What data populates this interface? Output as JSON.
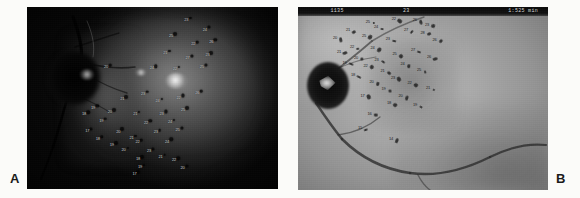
{
  "figure": {
    "background_color": "#fbfbf9",
    "panels": [
      {
        "id": "A",
        "label": "A",
        "modality": "fundus-photograph",
        "description": "Dark red-free fundus photograph of left eye showing optic disc nasally, bright exudative lesion near the macula, and scattered numbered grid annotations over the posterior pole.",
        "optic_disc_position": "left",
        "markers": [
          {
            "value": "23",
            "x": 63.5,
            "y": 7.0
          },
          {
            "value": "24",
            "x": 70.8,
            "y": 12.4
          },
          {
            "value": "25",
            "x": 57.4,
            "y": 16.0
          },
          {
            "value": "22",
            "x": 66.2,
            "y": 20.6
          },
          {
            "value": "26",
            "x": 73.4,
            "y": 19.1
          },
          {
            "value": "21",
            "x": 55.1,
            "y": 25.3
          },
          {
            "value": "27",
            "x": 64.0,
            "y": 27.9
          },
          {
            "value": "23",
            "x": 71.9,
            "y": 26.4
          },
          {
            "value": "20",
            "x": 31.5,
            "y": 33.1
          },
          {
            "value": "24",
            "x": 49.7,
            "y": 33.6
          },
          {
            "value": "22",
            "x": 59.0,
            "y": 34.2
          },
          {
            "value": "25",
            "x": 69.6,
            "y": 33.0
          },
          {
            "value": "21",
            "x": 38.0,
            "y": 50.6
          },
          {
            "value": "23",
            "x": 46.2,
            "y": 47.8
          },
          {
            "value": "19",
            "x": 26.3,
            "y": 55.4
          },
          {
            "value": "24",
            "x": 52.0,
            "y": 51.5
          },
          {
            "value": "22",
            "x": 60.4,
            "y": 49.8
          },
          {
            "value": "20",
            "x": 33.0,
            "y": 57.6
          },
          {
            "value": "26",
            "x": 67.8,
            "y": 47.4
          },
          {
            "value": "18",
            "x": 22.7,
            "y": 59.0
          },
          {
            "value": "21",
            "x": 43.1,
            "y": 58.9
          },
          {
            "value": "23",
            "x": 53.6,
            "y": 58.6
          },
          {
            "value": "25",
            "x": 62.2,
            "y": 56.6
          },
          {
            "value": "19",
            "x": 29.6,
            "y": 62.5
          },
          {
            "value": "22",
            "x": 47.4,
            "y": 63.6
          },
          {
            "value": "24",
            "x": 57.0,
            "y": 63.2
          },
          {
            "value": "17",
            "x": 24.0,
            "y": 68.2
          },
          {
            "value": "20",
            "x": 36.4,
            "y": 68.5
          },
          {
            "value": "23",
            "x": 51.3,
            "y": 68.8
          },
          {
            "value": "18",
            "x": 28.2,
            "y": 72.6
          },
          {
            "value": "21",
            "x": 41.6,
            "y": 72.0
          },
          {
            "value": "25",
            "x": 60.0,
            "y": 67.8
          },
          {
            "value": "19",
            "x": 33.8,
            "y": 76.0
          },
          {
            "value": "22",
            "x": 44.0,
            "y": 74.4
          },
          {
            "value": "24",
            "x": 55.8,
            "y": 74.0
          },
          {
            "value": "20",
            "x": 38.5,
            "y": 78.4
          },
          {
            "value": "23",
            "x": 48.6,
            "y": 79.2
          },
          {
            "value": "18",
            "x": 44.2,
            "y": 83.6
          },
          {
            "value": "21",
            "x": 53.2,
            "y": 82.4
          },
          {
            "value": "22",
            "x": 58.6,
            "y": 84.2
          },
          {
            "value": "19",
            "x": 45.0,
            "y": 87.8
          },
          {
            "value": "20",
            "x": 62.0,
            "y": 88.6
          },
          {
            "value": "17",
            "x": 42.8,
            "y": 92.0
          }
        ]
      },
      {
        "id": "B",
        "label": "B",
        "modality": "fundus-photograph",
        "description": "Lighter greyscale fundus photograph of right eye with prominent dark optic disc, cluster of dark hemorrhages and numbered annotations superotemporally, and a large vessel arcade crossing inferiorly.",
        "optic_disc_position": "left",
        "header": {
          "left": "1135",
          "center": "23",
          "right": "1:525 min"
        },
        "markers": [
          {
            "value": "25",
            "x": 27.9,
            "y": 8.0
          },
          {
            "value": "22",
            "x": 38.3,
            "y": 6.4
          },
          {
            "value": "26",
            "x": 46.7,
            "y": 7.2
          },
          {
            "value": "23",
            "x": 51.6,
            "y": 9.6
          },
          {
            "value": "21",
            "x": 20.0,
            "y": 12.4
          },
          {
            "value": "24",
            "x": 31.2,
            "y": 11.1
          },
          {
            "value": "27",
            "x": 43.2,
            "y": 12.8
          },
          {
            "value": "20",
            "x": 14.8,
            "y": 16.8
          },
          {
            "value": "25",
            "x": 26.4,
            "y": 15.6
          },
          {
            "value": "28",
            "x": 49.8,
            "y": 14.0
          },
          {
            "value": "23",
            "x": 35.9,
            "y": 17.4
          },
          {
            "value": "26",
            "x": 54.6,
            "y": 17.8
          },
          {
            "value": "22",
            "x": 21.6,
            "y": 21.8
          },
          {
            "value": "24",
            "x": 29.8,
            "y": 22.6
          },
          {
            "value": "21",
            "x": 16.4,
            "y": 24.4
          },
          {
            "value": "27",
            "x": 46.0,
            "y": 23.4
          },
          {
            "value": "25",
            "x": 38.6,
            "y": 25.8
          },
          {
            "value": "20",
            "x": 23.2,
            "y": 27.6
          },
          {
            "value": "23",
            "x": 31.4,
            "y": 28.9
          },
          {
            "value": "26",
            "x": 52.4,
            "y": 27.2
          },
          {
            "value": "19",
            "x": 18.6,
            "y": 30.4
          },
          {
            "value": "22",
            "x": 27.0,
            "y": 32.0
          },
          {
            "value": "24",
            "x": 41.8,
            "y": 31.4
          },
          {
            "value": "21",
            "x": 33.8,
            "y": 35.2
          },
          {
            "value": "25",
            "x": 48.4,
            "y": 34.6
          },
          {
            "value": "18",
            "x": 22.0,
            "y": 37.0
          },
          {
            "value": "23",
            "x": 38.0,
            "y": 38.6
          },
          {
            "value": "20",
            "x": 29.4,
            "y": 41.2
          },
          {
            "value": "22",
            "x": 44.6,
            "y": 41.8
          },
          {
            "value": "19",
            "x": 34.2,
            "y": 45.0
          },
          {
            "value": "21",
            "x": 52.0,
            "y": 44.2
          },
          {
            "value": "17",
            "x": 25.8,
            "y": 48.4
          },
          {
            "value": "20",
            "x": 41.0,
            "y": 48.8
          },
          {
            "value": "18",
            "x": 36.4,
            "y": 52.6
          },
          {
            "value": "16",
            "x": 28.6,
            "y": 58.2
          },
          {
            "value": "19",
            "x": 46.8,
            "y": 53.8
          },
          {
            "value": "15",
            "x": 24.8,
            "y": 66.0
          },
          {
            "value": "14",
            "x": 37.2,
            "y": 72.4
          }
        ]
      }
    ]
  }
}
